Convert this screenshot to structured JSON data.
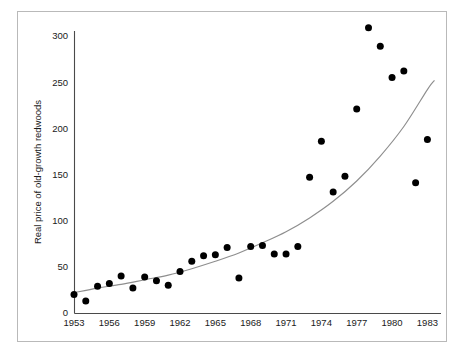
{
  "chart_data": {
    "type": "scatter",
    "title": "",
    "subtitle": "",
    "xlabel": "",
    "ylabel": "Real price of old-growth redwoods",
    "xlim": [
      1953,
      1984.5
    ],
    "ylim": [
      0,
      320
    ],
    "grid": false,
    "legend": null,
    "x_ticks": [
      1953,
      1956,
      1959,
      1962,
      1965,
      1968,
      1971,
      1974,
      1977,
      1980,
      1983
    ],
    "x_tick_labels": [
      "1953",
      "1956",
      "1959",
      "1962",
      "1965",
      "1968",
      "1971",
      "1974",
      "1977",
      "1980",
      "1983"
    ],
    "y_ticks": [
      0,
      50,
      100,
      150,
      200,
      250,
      300
    ],
    "y_tick_labels": [
      "0",
      "50",
      "100",
      "150",
      "200",
      "250",
      "300"
    ],
    "point_color": "#000000",
    "curve_color": "#8e8e8e",
    "axis_color": "#4a4a4a",
    "series": [
      {
        "name": "Real price of old-growth redwoods",
        "marker": "filled-circle",
        "x": [
          1953,
          1954,
          1955,
          1956,
          1957,
          1958,
          1959,
          1960,
          1961,
          1962,
          1963,
          1964,
          1965,
          1966,
          1967,
          1968,
          1969,
          1970,
          1971,
          1972,
          1973,
          1974,
          1975,
          1976,
          1977,
          1978,
          1979,
          1980,
          1981,
          1982,
          1983
        ],
        "y": [
          20,
          13,
          29,
          32,
          40,
          27,
          39,
          35,
          30,
          45,
          56,
          62,
          63,
          71,
          38,
          72,
          73,
          64,
          64,
          72,
          147,
          186,
          131,
          148,
          221,
          309,
          289,
          255,
          262,
          141,
          188
        ]
      }
    ],
    "fit_curve": {
      "name": "exponential trend",
      "color": "#8e8e8e",
      "x": [
        1953,
        1955,
        1957,
        1959,
        1961,
        1963,
        1965,
        1967,
        1969,
        1971,
        1973,
        1975,
        1977,
        1979,
        1981,
        1983,
        1983.6
      ],
      "y": [
        22,
        27,
        31,
        36,
        41,
        48,
        56,
        65,
        76,
        88,
        103,
        121,
        143,
        170,
        202,
        242,
        252
      ]
    }
  },
  "figure": {
    "frame_border_color": "#b9b9b9",
    "background": "#ffffff"
  }
}
